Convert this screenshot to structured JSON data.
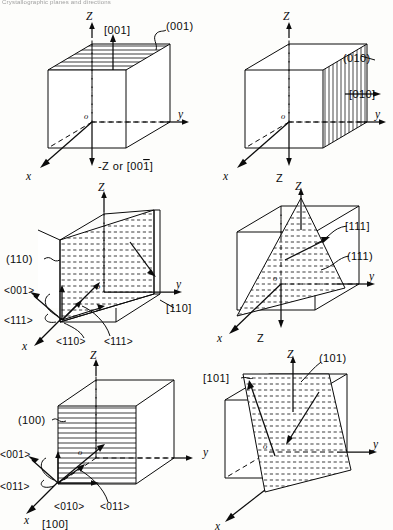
{
  "figure": {
    "header_text": "Crystallographic planes and directions",
    "background_color": "#fdfdfb",
    "line_color": "#0b0b0b",
    "panel_count": 6
  },
  "axes": {
    "z_up": "Z",
    "z_down": "Z",
    "y": "y",
    "x": "x",
    "origin": "o"
  },
  "panels": [
    {
      "id": "panel-001",
      "position": "top-left",
      "plane_label": "(001)",
      "direction_label": "[001]",
      "negative_axis_label": "-Z or [001]",
      "negative_axis_overbar_digit": "1",
      "fill_style": "horizontal-lines",
      "plane_location": "top-face"
    },
    {
      "id": "panel-010",
      "position": "top-right",
      "plane_label": "(010)",
      "direction_label": "[010]",
      "fill_style": "vertical-lines",
      "plane_location": "right-face"
    },
    {
      "id": "panel-110",
      "position": "middle-left",
      "plane_label": "(110)",
      "direction_label": "[110]",
      "fill_style": "dashed-horizontal",
      "plane_location": "diagonal-face",
      "direction_family_labels": [
        "<001>",
        "<111>",
        "<110>",
        "<111>"
      ]
    },
    {
      "id": "panel-111",
      "position": "middle-right",
      "plane_label": "(111)",
      "direction_label": "[111]",
      "fill_style": "dashed-horizontal",
      "plane_location": "triangular-face"
    },
    {
      "id": "panel-100",
      "position": "bottom-left",
      "plane_label": "(100)",
      "direction_label": "[100]",
      "fill_style": "horizontal-lines",
      "plane_location": "front-face",
      "direction_family_labels": [
        "<001>",
        "<011>",
        "<010>",
        "<011>"
      ]
    },
    {
      "id": "panel-101",
      "position": "bottom-right",
      "plane_label": "(101)",
      "direction_label": "[101]",
      "fill_style": "dashed-horizontal",
      "plane_location": "diagonal-face"
    }
  ]
}
